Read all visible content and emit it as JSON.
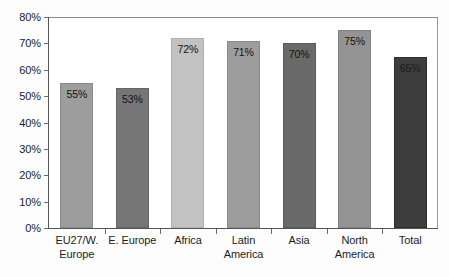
{
  "chart_data": {
    "type": "bar",
    "title": "",
    "subtitle": "",
    "xlabel": "",
    "ylabel": "",
    "ylim": [
      0,
      80
    ],
    "grid": false,
    "legend": null,
    "y_ticks": [
      "0%",
      "10%",
      "20%",
      "30%",
      "40%",
      "50%",
      "60%",
      "70%",
      "80%"
    ],
    "y_tick_values": [
      0,
      10,
      20,
      30,
      40,
      50,
      60,
      70,
      80
    ],
    "categories": [
      "EU27/W. Europe",
      "E. Europe",
      "Africa",
      "Latin America",
      "Asia",
      "North America",
      "Total"
    ],
    "category_lines": [
      [
        "EU27/W.",
        "Europe"
      ],
      [
        "E. Europe"
      ],
      [
        "Africa"
      ],
      [
        "Latin",
        "America"
      ],
      [
        "Asia"
      ],
      [
        "North",
        "America"
      ],
      [
        "Total"
      ]
    ],
    "values": [
      55,
      53,
      72,
      71,
      70,
      75,
      65
    ],
    "value_labels": [
      "55%",
      "53%",
      "72%",
      "71%",
      "70%",
      "75%",
      "65%"
    ],
    "bar_colors": [
      "#9d9d9d",
      "#767676",
      "#c2c2c2",
      "#9d9d9d",
      "#6a6a6a",
      "#949494",
      "#3d3d3d"
    ],
    "bar_border_colors": [
      "#8a8a8a",
      "#666666",
      "#b0b0b0",
      "#8a8a8a",
      "#5a5a5a",
      "#828282",
      "#2e2e2e"
    ]
  },
  "axis_color": "#555555",
  "frame_color": "#9a9a9a",
  "text_color": "#1c1c1c"
}
